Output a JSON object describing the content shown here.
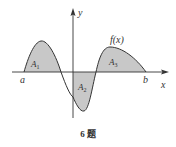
{
  "figure": {
    "caption": "6 题",
    "function_label": "f(x)",
    "axes": {
      "x_label": "x",
      "y_label": "y"
    },
    "points": {
      "a": "a",
      "b": "b"
    },
    "regions": [
      {
        "name": "A",
        "sub": "1",
        "sign": "positive"
      },
      {
        "name": "A",
        "sub": "2",
        "sign": "negative"
      },
      {
        "name": "A",
        "sub": "3",
        "sign": "positive"
      }
    ],
    "colors": {
      "shade": "#c8c8c8",
      "stroke": "#333333",
      "axis": "#333333"
    }
  }
}
